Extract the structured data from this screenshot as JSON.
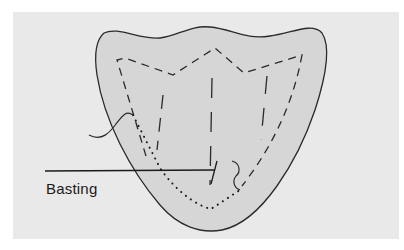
{
  "figure": {
    "background_color": "#e9e9e9",
    "shape_fill": "#d6d6d6",
    "stroke_color": "#2a2a2a",
    "labels": [
      {
        "id": "basting",
        "text": "Basting"
      }
    ]
  }
}
